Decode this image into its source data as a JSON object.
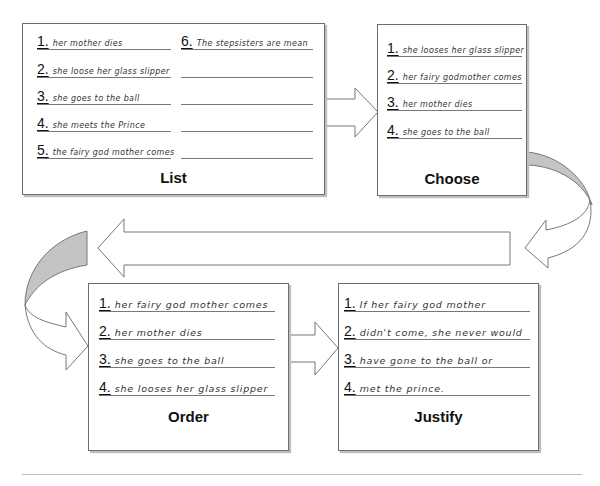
{
  "list_box": {
    "title": "List",
    "items": [
      {
        "num": "1.",
        "text": "her mother dies"
      },
      {
        "num": "2.",
        "text": "she loose her glass slipper"
      },
      {
        "num": "3.",
        "text": "she goes to the ball"
      },
      {
        "num": "4.",
        "text": "she meets the Prince"
      },
      {
        "num": "5.",
        "text": "the fairy god mother comes"
      },
      {
        "num": "6.",
        "text": "The stepsisters are mean"
      }
    ]
  },
  "choose_box": {
    "title": "Choose",
    "items": [
      {
        "num": "1.",
        "text": "she looses her glass slipper"
      },
      {
        "num": "2.",
        "text": "her fairy godmother comes"
      },
      {
        "num": "3.",
        "text": "her mother dies"
      },
      {
        "num": "4.",
        "text": "she goes to the ball"
      }
    ]
  },
  "order_box": {
    "title": "Order",
    "items": [
      {
        "num": "1.",
        "text": "her fairy god mother comes"
      },
      {
        "num": "2.",
        "text": "her mother dies"
      },
      {
        "num": "3.",
        "text": "she goes to the ball"
      },
      {
        "num": "4.",
        "text": "she looses her glass slipper"
      }
    ]
  },
  "justify_box": {
    "title": "Justify",
    "items": [
      {
        "num": "1.",
        "text": "If her fairy god mother"
      },
      {
        "num": "2.",
        "text": "didn't come, she never would"
      },
      {
        "num": "3.",
        "text": "have gone to the ball or"
      },
      {
        "num": "4.",
        "text": "met the prince."
      }
    ]
  },
  "colors": {
    "border": "#6e6e6e",
    "shadow": "#bdbdbd",
    "curved_arrow_fill": "#c4c4c4"
  }
}
